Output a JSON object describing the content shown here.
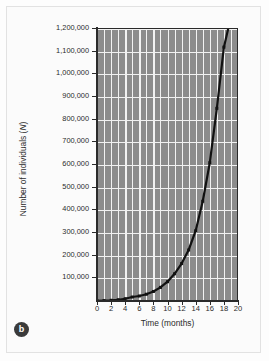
{
  "figure": {
    "panel_label": "b",
    "background_color": "#fdfdfd",
    "plot_background_color": "#8c8c8c",
    "gridline_color": "#f2f2f2",
    "curve_color": "#111111",
    "axis_color": "#2a2a2a"
  },
  "chart_data": {
    "type": "line",
    "title": "",
    "subtitle": "",
    "xlabel": "Time (months)",
    "ylabel": "Number of individuals (N)",
    "ylabel_parts": {
      "text": "Number of individuals (",
      "symbol": "N",
      "suffix": ")"
    },
    "xlim": [
      0,
      20
    ],
    "ylim": [
      0,
      1200000
    ],
    "grid": true,
    "legend": null,
    "x_ticks": [
      0,
      2,
      4,
      6,
      8,
      10,
      12,
      14,
      16,
      18,
      20
    ],
    "x_tick_labels": [
      "0",
      "2",
      "4",
      "6",
      "8",
      "10",
      "12",
      "14",
      "16",
      "18",
      "20"
    ],
    "x_minor_step": 1,
    "y_ticks": [
      100000,
      200000,
      300000,
      400000,
      500000,
      600000,
      700000,
      800000,
      900000,
      1000000,
      1100000,
      1200000
    ],
    "y_tick_labels": [
      "100,000",
      "200,000",
      "300,000",
      "400,000",
      "500,000",
      "600,000",
      "700,000",
      "800,000",
      "900,000",
      "1,000,000",
      "1,100,000",
      "1,200,000"
    ],
    "series": [
      {
        "name": "Exponential population growth",
        "marker": "square",
        "x": [
          0,
          1,
          2,
          3,
          4,
          5,
          6,
          7,
          8,
          9,
          10,
          11,
          12,
          13,
          14,
          15,
          16,
          17,
          18,
          18.6
        ],
        "values": [
          1000,
          1800,
          3200,
          5600,
          10000,
          17500,
          22000,
          30000,
          42000,
          60000,
          85000,
          120000,
          165000,
          225000,
          310000,
          440000,
          610000,
          850000,
          1120000,
          1200000
        ]
      }
    ],
    "annotations": []
  }
}
